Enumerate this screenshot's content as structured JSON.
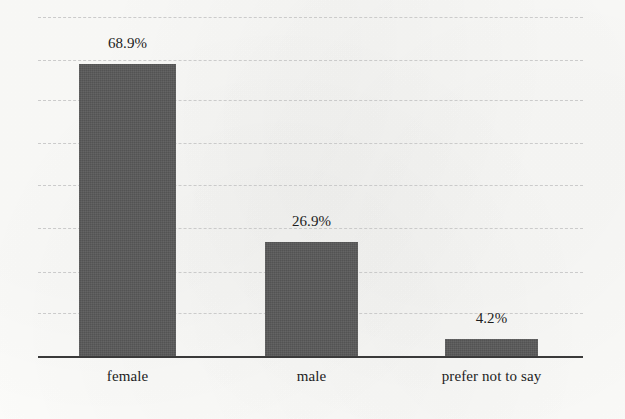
{
  "chart_data": {
    "type": "bar",
    "title": "",
    "subtitle": "",
    "xlabel": "",
    "ylabel": "",
    "categories": [
      "female",
      "male",
      "prefer not to say"
    ],
    "values": [
      68.9,
      26.9,
      4.2
    ],
    "value_labels": [
      "68.9%",
      "26.9%",
      "4.2%"
    ],
    "ylim": [
      0,
      80
    ],
    "y_tick_values": [
      10,
      20,
      30,
      40,
      50,
      60,
      70,
      80
    ],
    "y_tick_labels_visible": false,
    "grid": "horizontal-dashed",
    "legend": "none",
    "series": [
      {
        "name": "percentage of respondents",
        "values": [
          68.9,
          26.9,
          4.2
        ]
      }
    ],
    "annotations": [
      {
        "text": "68.9%",
        "category": "female",
        "position": "above-bar"
      },
      {
        "text": "26.9%",
        "category": "male",
        "position": "above-bar"
      },
      {
        "text": "4.2%",
        "category": "prefer not to say",
        "position": "above-bar"
      }
    ]
  },
  "style": {
    "bar_color": "#595959",
    "axis_color": "#3a3a3a",
    "grid_color": "#c9c9c9",
    "text_color": "#1d1d1d",
    "background_color": "#fdfdfb"
  },
  "geometry": {
    "plot_left": 38,
    "plot_right": 583,
    "baseline_y": 356,
    "gridline_y": [
      17,
      60,
      100,
      143,
      185,
      228,
      272,
      313
    ],
    "bars": [
      {
        "left": 79,
        "right": 176,
        "top": 62
      },
      {
        "left": 265,
        "right": 358,
        "top": 240
      },
      {
        "left": 445,
        "right": 538,
        "top": 337
      }
    ],
    "value_label_y": [
      36,
      214,
      311
    ],
    "category_label_y": 369
  }
}
